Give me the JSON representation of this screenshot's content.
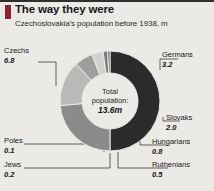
{
  "header": {
    "title": "The way they were",
    "subtitle": "Czechoslovakia's population before 1938, m",
    "accent_color": "#8f2130",
    "rule_color": "#2f2f2f"
  },
  "center": {
    "line1": "Total",
    "line2": "population:",
    "total": "13.6m"
  },
  "chart_data": {
    "type": "pie",
    "title": "The way they were",
    "subtitle": "Czechoslovakia's population before 1938, m",
    "unit": "m",
    "total": 13.6,
    "total_label": "13.6m",
    "donut": true,
    "legend_position": "callout-labels",
    "grid": false,
    "categories": [
      "Czechs",
      "Germans",
      "Slovaks",
      "Hungarians",
      "Ruthenians",
      "Jews",
      "Poles"
    ],
    "values": [
      6.8,
      3.2,
      2.0,
      0.8,
      0.5,
      0.2,
      0.1
    ],
    "value_labels": [
      "6.8",
      "3.2",
      "2.0",
      "0.8",
      "0.5",
      "0.2",
      "0.1"
    ],
    "colors": [
      "#2b2b2d",
      "#8b8b8b",
      "#b9b9b7",
      "#9e9e9c",
      "#d2d2d0",
      "#7a7a78",
      "#5d5d5c"
    ]
  },
  "labels": {
    "czechs": {
      "cat": "Czechs",
      "val": "6.8"
    },
    "germans": {
      "cat": "Germans",
      "val": "3.2"
    },
    "slovaks": {
      "cat": "Slovaks",
      "val": "2.0"
    },
    "hungarians": {
      "cat": "Hungarians",
      "val": "0.8"
    },
    "ruthenians": {
      "cat": "Ruthenians",
      "val": "0.5"
    },
    "poles": {
      "cat": "Poles",
      "val": "0.1"
    },
    "jews": {
      "cat": "Jews",
      "val": "0.2"
    }
  }
}
